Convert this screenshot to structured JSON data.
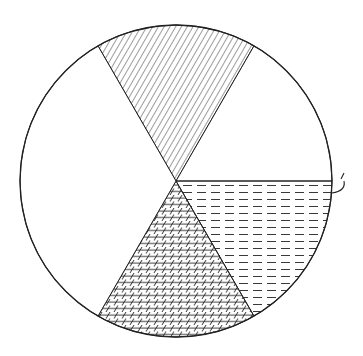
{
  "figure": {
    "type": "pie-diagram",
    "stroke_color": "#222222",
    "background": "#ffffff",
    "center": [
      176,
      181
    ],
    "radius": 156,
    "sectors": [
      {
        "name": "top-sector",
        "pattern": "diagonal-hatch",
        "start_deg": -120,
        "end_deg": -60
      },
      {
        "name": "upper-right-sector",
        "pattern": "blank",
        "start_deg": -60,
        "end_deg": 0
      },
      {
        "name": "lower-right-sector",
        "pattern": "dashed-horizontal",
        "start_deg": 0,
        "end_deg": 60
      },
      {
        "name": "bottom-sector",
        "pattern": "crosshatch",
        "start_deg": 60,
        "end_deg": 120
      },
      {
        "name": "left-sector",
        "pattern": "blank",
        "start_deg": 120,
        "end_deg": 240
      }
    ],
    "annotation": {
      "name": "hook-mark",
      "position": [
        342,
        181
      ]
    }
  }
}
